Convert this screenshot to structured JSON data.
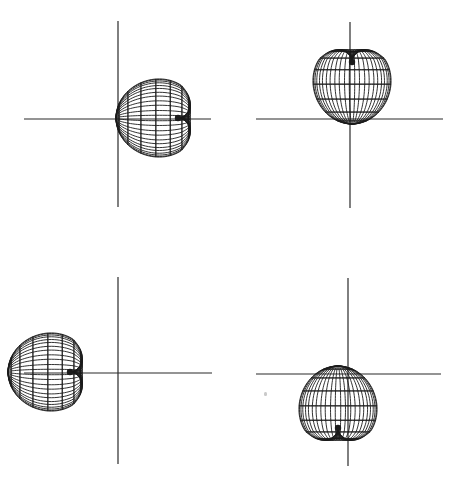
{
  "figure": {
    "width": 466,
    "height": 496,
    "background_color": "#ffffff",
    "ink_color": "#1b1b1b",
    "axis_color": "#2a2a2a",
    "axis_width": 1.2,
    "mesh_width": 0.9
  },
  "chart_data": {
    "type": "line",
    "title": "",
    "subtitle": "",
    "xlabel": "",
    "ylabel": "",
    "grid": false,
    "legend_position": "none",
    "layout": {
      "rows": 2,
      "cols": 2
    },
    "pattern_model": {
      "name": "cardioid-lobe-wireframe",
      "formula": "r(theta) = R * (0.5 + 0.5*cos(theta)) ^ p , revolved about the lobe axis",
      "R": 62,
      "p": 0.62,
      "notch_depth": 0.17,
      "rings": 11,
      "spokes": 24,
      "surface_tilt_deg": 26,
      "squash_y": 0.86
    },
    "panels": [
      {
        "id": "top-left",
        "label": "panel-a",
        "origin": [
          118,
          119
        ],
        "pole": [
          178,
          118
        ],
        "axis_rotation_deg": 180,
        "lobe_direction": "left",
        "max_radius": 62,
        "h_axis_extent": [
          24,
          211
        ],
        "v_axis_extent": [
          21,
          207
        ]
      },
      {
        "id": "top-right",
        "label": "panel-b",
        "origin": [
          350,
          119
        ],
        "pole": [
          352,
          62
        ],
        "axis_rotation_deg": 90,
        "lobe_direction": "up",
        "max_radius": 60,
        "h_axis_extent": [
          256,
          443
        ],
        "v_axis_extent": [
          22,
          208
        ]
      },
      {
        "id": "bottom-left",
        "label": "panel-c",
        "origin": [
          118,
          373
        ],
        "pole": [
          70,
          372
        ],
        "axis_rotation_deg": 180,
        "lobe_direction": "left",
        "max_radius": 62,
        "h_axis_extent": [
          24,
          212
        ],
        "v_axis_extent": [
          277,
          464
        ]
      },
      {
        "id": "bottom-right",
        "label": "panel-d",
        "origin": [
          348,
          374
        ],
        "pole": [
          338,
          428
        ],
        "axis_rotation_deg": 270,
        "lobe_direction": "down",
        "max_radius": 61,
        "h_axis_extent": [
          256,
          441
        ],
        "v_axis_extent": [
          278,
          466
        ]
      }
    ],
    "artifacts": [
      {
        "name": "scan-speckle",
        "position": [
          264,
          392
        ]
      }
    ]
  }
}
